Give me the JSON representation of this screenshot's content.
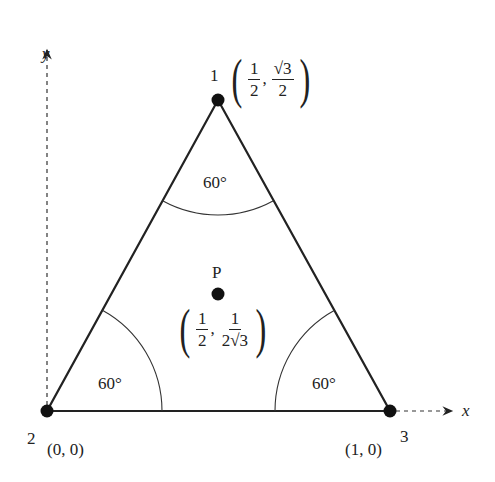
{
  "figure": {
    "axes": {
      "x_label": "x",
      "y_label": "y"
    },
    "vertices": [
      {
        "id": "1",
        "label": "1",
        "coord": {
          "x_num": "1",
          "x_den": "2",
          "y_num": "√3",
          "y_den": "2"
        }
      },
      {
        "id": "2",
        "label": "2",
        "coord_text": "(0, 0)"
      },
      {
        "id": "3",
        "label": "3",
        "coord_text": "(1, 0)"
      }
    ],
    "point_p": {
      "label": "P",
      "coord": {
        "x_num": "1",
        "x_den": "2",
        "y_num": "1",
        "y_den": "2√3"
      }
    },
    "angles": [
      "60°",
      "60°",
      "60°"
    ],
    "comma": ","
  }
}
